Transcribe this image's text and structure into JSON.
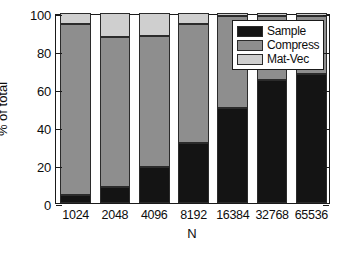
{
  "chart_data": {
    "type": "bar",
    "subtype": "stacked-bar-percent",
    "title": "",
    "xlabel": "N",
    "ylabel": "% of total",
    "categories": [
      "1024",
      "2048",
      "4096",
      "8192",
      "16384",
      "32768",
      "65536"
    ],
    "series": [
      {
        "name": "Sample",
        "color": "#141414",
        "values": [
          4,
          8.5,
          19,
          31.5,
          50,
          64.5,
          68
        ]
      },
      {
        "name": "Compress",
        "color": "#8e8e8e",
        "values": [
          90,
          79,
          69,
          62.5,
          48.5,
          34,
          30.5
        ]
      },
      {
        "name": "Mat-Vec",
        "color": "#cfcfcf",
        "values": [
          6,
          12.5,
          12,
          6,
          1.5,
          1.5,
          1.5
        ]
      }
    ],
    "ylim": [
      0,
      100
    ],
    "yticks": [
      0,
      20,
      40,
      60,
      80,
      100
    ],
    "ytick_labels": [
      "0",
      "20",
      "40",
      "60",
      "80",
      "100"
    ],
    "grid": false,
    "legend_position": "top-right",
    "legend_entries": [
      "Sample",
      "Compress",
      "Mat-Vec"
    ]
  },
  "axes": {
    "y_title": "% of total",
    "x_title": "N"
  },
  "legend": {
    "items": [
      {
        "label": "Sample"
      },
      {
        "label": "Compress"
      },
      {
        "label": "Mat-Vec"
      }
    ]
  }
}
